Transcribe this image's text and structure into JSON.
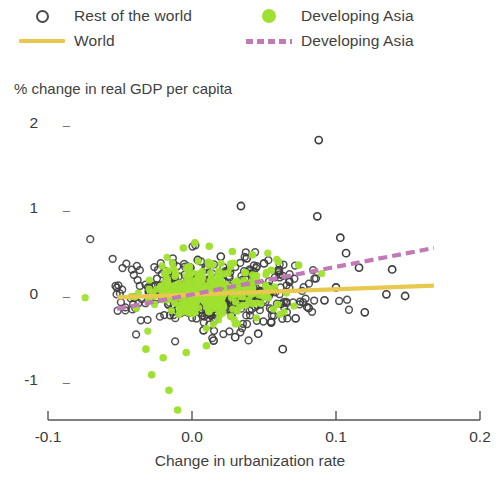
{
  "legend": {
    "entries": [
      {
        "label": "Rest of the world",
        "marker": "open-circle-marker",
        "color": "#4a4a4a"
      },
      {
        "label": "Developing Asia",
        "marker": "filled-dot-marker",
        "color": "#a0e030"
      },
      {
        "label": "World",
        "marker": "solid-line-marker",
        "color": "#e9c84e"
      },
      {
        "label": "Developing Asia",
        "marker": "dashed-line-marker",
        "color": "#c27ab7"
      }
    ]
  },
  "chart_data": {
    "type": "scatter",
    "title": "",
    "ylabel": "% change in real GDP per capita",
    "xlabel": "Change in urbanization rate",
    "xlim": [
      -0.1,
      0.2
    ],
    "ylim": [
      -1.45,
      2.2
    ],
    "xticks": [
      -0.1,
      0.0,
      0.1,
      0.2
    ],
    "xtick_labels": [
      "-0.1",
      "0.0",
      "0.1",
      "0.2"
    ],
    "yticks": [
      2,
      1,
      0,
      -1
    ],
    "ytick_labels": [
      "2",
      "1",
      "0",
      "-1"
    ],
    "grid": false,
    "legend_position": "above-plot",
    "series": [
      {
        "name": "Rest of the world",
        "marker": "open circle",
        "color": "#3d3d3d",
        "n_points": 430,
        "x_center": 0.018,
        "x_spread": 0.03,
        "y_center": 0.03,
        "y_spread": 0.2,
        "points": [
          [
            0.088,
            1.82
          ],
          [
            0.034,
            1.05
          ],
          [
            0.087,
            0.93
          ],
          [
            0.103,
            0.68
          ],
          [
            0.107,
            0.5
          ],
          [
            0.116,
            0.33
          ],
          [
            0.139,
            0.31
          ],
          [
            0.135,
            0.02
          ],
          [
            0.12,
            -0.19
          ],
          [
            0.148,
            0.0
          ],
          [
            0.063,
            -0.62
          ],
          [
            0.046,
            -0.44
          ],
          [
            0.03,
            -0.48
          ],
          [
            0.015,
            -0.52
          ],
          [
            0.008,
            -0.4
          ],
          [
            0.055,
            -0.31
          ],
          [
            0.072,
            -0.26
          ],
          [
            0.081,
            -0.14
          ],
          [
            0.092,
            -0.05
          ],
          [
            0.1,
            0.1
          ],
          [
            0.004,
            0.42
          ],
          [
            0.02,
            0.46
          ],
          [
            0.038,
            0.44
          ],
          [
            0.05,
            0.38
          ],
          [
            -0.012,
            0.22
          ],
          [
            -0.022,
            0.12
          ],
          [
            -0.03,
            0.05
          ],
          [
            -0.04,
            -0.02
          ]
        ]
      },
      {
        "name": "Developing Asia",
        "marker": "filled dot",
        "color": "#a0e030",
        "n_points": 300,
        "x_center": 0.012,
        "x_spread": 0.022,
        "y_center": 0.05,
        "y_spread": 0.17,
        "points": [
          [
            -0.01,
            -1.33
          ],
          [
            -0.016,
            -1.1
          ],
          [
            -0.028,
            -0.92
          ],
          [
            -0.02,
            -0.72
          ],
          [
            -0.032,
            -0.62
          ],
          [
            -0.004,
            -0.66
          ],
          [
            0.01,
            -0.58
          ],
          [
            0.002,
            0.62
          ],
          [
            0.012,
            0.58
          ],
          [
            0.028,
            0.52
          ],
          [
            0.042,
            0.48
          ],
          [
            0.06,
            0.4
          ],
          [
            0.074,
            0.36
          ],
          [
            0.055,
            0.3
          ],
          [
            -0.006,
            0.56
          ]
        ]
      }
    ],
    "trend_lines": [
      {
        "name": "World",
        "style": "solid",
        "color": "#e9c84e",
        "x_start": -0.052,
        "y_start": -0.015,
        "x_end": 0.168,
        "y_end": 0.12
      },
      {
        "name": "Developing Asia",
        "style": "dashed",
        "color": "#c27ab7",
        "x_start": -0.052,
        "y_start": -0.15,
        "x_end": 0.168,
        "y_end": 0.56
      }
    ]
  }
}
